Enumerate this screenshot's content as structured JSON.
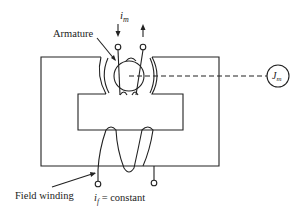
{
  "diagram": {
    "type": "dc-motor-schematic",
    "labels": {
      "armature": "Armature",
      "armature_current_symbol": "i",
      "armature_current_subscript": "m",
      "inertia_symbol": "J",
      "inertia_subscript": "m",
      "field_winding": "Field winding",
      "field_current_symbol": "i",
      "field_current_subscript": "f",
      "field_current_condition": " = constant"
    },
    "colors": {
      "line": "#222222",
      "background": "#ffffff"
    }
  }
}
